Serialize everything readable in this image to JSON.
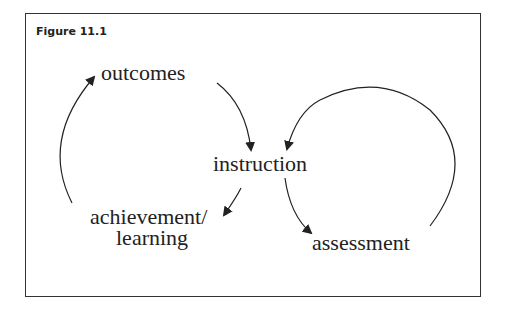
{
  "figure": {
    "title": "Figure 11.1"
  },
  "nodes": {
    "outcomes": "outcomes",
    "instruction": "instruction",
    "achievement_line1": "achievement/",
    "achievement_line2": "learning",
    "assessment": "assessment"
  },
  "edges": [
    {
      "from": "outcomes",
      "to": "instruction"
    },
    {
      "from": "instruction",
      "to": "achievement/learning"
    },
    {
      "from": "achievement/learning",
      "to": "outcomes"
    },
    {
      "from": "instruction",
      "to": "assessment"
    },
    {
      "from": "assessment",
      "to": "instruction"
    }
  ],
  "colors": {
    "line": "#222222",
    "border": "#333333"
  }
}
